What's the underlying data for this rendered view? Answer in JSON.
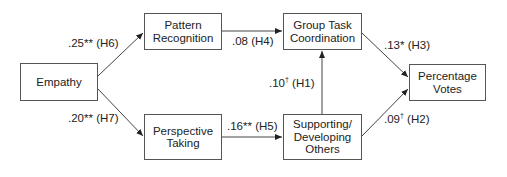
{
  "diagram": {
    "nodes": {
      "empathy": "Empathy",
      "pattern_recognition": "Pattern\nRecognition",
      "perspective_taking": "Perspective\nTaking",
      "group_task_coordination": "Group Task\nCoordination",
      "supporting_developing_others": "Supporting/\nDeveloping\nOthers",
      "percentage_votes": "Percentage\nVotes"
    },
    "edges": [
      {
        "from": "Empathy",
        "to": "Pattern Recognition",
        "coef": ".25",
        "sig": "**",
        "hyp": "(H6)"
      },
      {
        "from": "Empathy",
        "to": "Perspective Taking",
        "coef": ".20",
        "sig": "**",
        "hyp": "(H7)"
      },
      {
        "from": "Pattern Recognition",
        "to": "Group Task Coordination",
        "coef": ".08",
        "sig": "",
        "hyp": "(H4)"
      },
      {
        "from": "Perspective Taking",
        "to": "Supporting/Developing Others",
        "coef": ".16",
        "sig": "**",
        "hyp": "(H5)"
      },
      {
        "from": "Supporting/Developing Others",
        "to": "Group Task Coordination",
        "coef": ".10",
        "sig": "†",
        "hyp": "(H1)"
      },
      {
        "from": "Group Task Coordination",
        "to": "Percentage Votes",
        "coef": ".13",
        "sig": "*",
        "hyp": "(H3)"
      },
      {
        "from": "Supporting/Developing Others",
        "to": "Percentage Votes",
        "coef": ".09",
        "sig": "†",
        "hyp": "(H2)"
      }
    ]
  }
}
